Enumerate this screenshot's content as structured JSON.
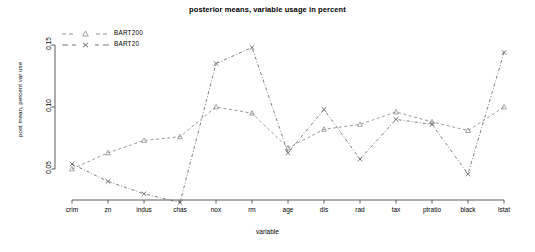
{
  "chart_data": {
    "type": "line",
    "title": "posterior means, variable usage in percent",
    "xlabel": "variable",
    "ylabel": "post mean, percent var use",
    "categories": [
      "crim",
      "zn",
      "indus",
      "chas",
      "nox",
      "rm",
      "age",
      "dis",
      "rad",
      "tax",
      "ptratio",
      "black",
      "lstat"
    ],
    "yticks": [
      0.05,
      0.1,
      0.15
    ],
    "ytick_labels": [
      "0.05",
      "0.10",
      "0.15"
    ],
    "ylim": [
      0.02,
      0.152
    ],
    "xlim": [
      0.5,
      13.5
    ],
    "grid": false,
    "legend_position": "top-left",
    "series": [
      {
        "name": "BART200",
        "marker": "triangle",
        "color": "#777777",
        "linestyle": "dashed",
        "values": [
          0.05,
          0.063,
          0.073,
          0.076,
          0.1,
          0.095,
          0.067,
          0.082,
          0.086,
          0.096,
          0.088,
          0.081,
          0.1
        ]
      },
      {
        "name": "BART20",
        "marker": "x",
        "color": "#555555",
        "linestyle": "dashdot",
        "values": [
          0.054,
          0.04,
          0.03,
          0.023,
          0.135,
          0.148,
          0.063,
          0.098,
          0.058,
          0.09,
          0.086,
          0.046,
          0.144
        ]
      }
    ]
  },
  "legend": {
    "entries": [
      {
        "label": "BART200"
      },
      {
        "label": "BART20"
      }
    ]
  }
}
